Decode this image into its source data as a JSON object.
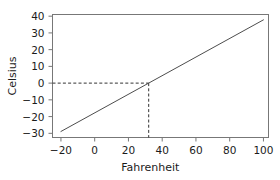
{
  "chart_data": {
    "type": "line",
    "title": "",
    "xlabel": "Fahrenheit",
    "ylabel": "Celsius",
    "xlim": [
      -25,
      103
    ],
    "ylim": [
      -32.5,
      41
    ],
    "grid": false,
    "legend": null,
    "xticks": [
      -20,
      0,
      20,
      40,
      60,
      80,
      100
    ],
    "xtick_labels": [
      "−20",
      "0",
      "20",
      "40",
      "60",
      "80",
      "100"
    ],
    "yticks": [
      -30,
      -20,
      -10,
      0,
      10,
      20,
      30,
      40
    ],
    "ytick_labels": [
      "−30",
      "−20",
      "−10",
      "0",
      "10",
      "20",
      "30",
      "40"
    ],
    "series": [
      {
        "name": "Fahrenheit to Celsius",
        "x": [
          -20,
          100
        ],
        "values": [
          -28.9,
          37.8
        ],
        "style": "solid",
        "color": "#4d4d4d"
      }
    ],
    "annotations": [
      {
        "name": "freezing-point-guide-horizontal",
        "style": "dashed",
        "color": "#333333",
        "from": [
          -25,
          0
        ],
        "to": [
          32,
          0
        ]
      },
      {
        "name": "freezing-point-guide-vertical",
        "style": "dashed",
        "color": "#333333",
        "from": [
          32,
          0
        ],
        "to": [
          32,
          -32.5
        ]
      }
    ],
    "axis_color": "#777777",
    "text_color": "#1b1b1b",
    "background": "#ffffff"
  }
}
